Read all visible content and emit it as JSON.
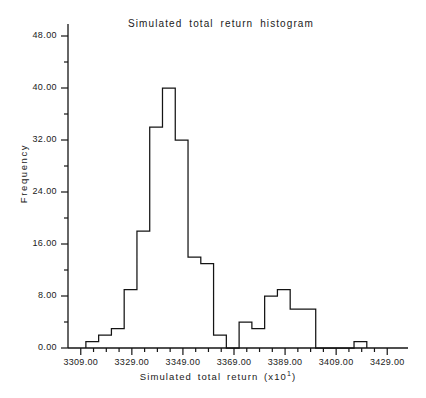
{
  "chart_data": {
    "type": "bar",
    "title": "Simulated  total  return  histogram",
    "xlabel": "Simulated  total  return  (x10",
    "xlabel_exponent": "1",
    "xlabel_close": ")",
    "ylabel": "Frequency",
    "xlim": [
      3304,
      3434
    ],
    "ylim": [
      0,
      48
    ],
    "grid": false,
    "legend": null,
    "bin_width": 5,
    "y_ticks": [
      "0.00",
      "8.00",
      "16.00",
      "24.00",
      "32.00",
      "40.00",
      "48.00"
    ],
    "y_tick_values": [
      0,
      8,
      16,
      24,
      32,
      40,
      48
    ],
    "y_minor_tick_step": 4,
    "x_ticks": [
      "3309.00",
      "3329.00",
      "3349.00",
      "3369.00",
      "3389.00",
      "3409.00",
      "3429.00"
    ],
    "x_tick_values": [
      3309,
      3329,
      3349,
      3369,
      3389,
      3409,
      3429
    ],
    "x_minor_tick_step": 5,
    "bin_starts": [
      3311,
      3316,
      3321,
      3326,
      3331,
      3336,
      3341,
      3346,
      3351,
      3356,
      3361,
      3366,
      3371,
      3376,
      3381,
      3386,
      3391,
      3396,
      3401,
      3416
    ],
    "categories": [
      "3311",
      "3316",
      "3321",
      "3326",
      "3331",
      "3336",
      "3341",
      "3346",
      "3351",
      "3356",
      "3361",
      "3366",
      "3371",
      "3376",
      "3381",
      "3386",
      "3391",
      "3396",
      "3401",
      "3416"
    ],
    "values": [
      1,
      2,
      3,
      9,
      18,
      34,
      40,
      32,
      14,
      13,
      2,
      0,
      4,
      3,
      8,
      9,
      6,
      6,
      0,
      1
    ],
    "series": [
      {
        "name": "Simulated total return frequency",
        "values": [
          1,
          2,
          3,
          9,
          18,
          34,
          40,
          32,
          14,
          13,
          2,
          0,
          4,
          3,
          8,
          9,
          6,
          6,
          0,
          1
        ]
      }
    ],
    "line_color": "#141414",
    "fill_color": "#ffffff",
    "axis_color": "#141414"
  }
}
